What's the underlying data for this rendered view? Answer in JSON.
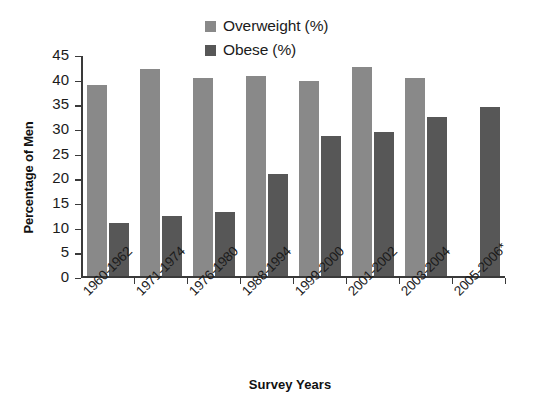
{
  "chart_data": {
    "type": "bar",
    "title": "",
    "xlabel": "Survey Years",
    "ylabel": "Percentage of Men",
    "categories": [
      "1960-1962",
      "1971-1974",
      "1976-1980",
      "1988-1994",
      "1999-2000",
      "2001-2002",
      "2003-2004",
      "2005-2006*"
    ],
    "series": [
      {
        "name": "Overweight (%)",
        "color": "#898989",
        "values": [
          38.9,
          42.0,
          40.2,
          40.6,
          39.7,
          42.4,
          40.3,
          null
        ]
      },
      {
        "name": "Obese (%)",
        "color": "#575757",
        "values": [
          10.9,
          12.2,
          13.0,
          20.8,
          28.4,
          29.2,
          32.4,
          34.4
        ]
      }
    ],
    "ylim": [
      0,
      45
    ],
    "ytick_labels": [
      "0",
      "5",
      "10",
      "15",
      "20",
      "25",
      "30",
      "35",
      "40",
      "45"
    ],
    "ytick_values": [
      0,
      5,
      10,
      15,
      20,
      25,
      30,
      35,
      40,
      45
    ],
    "grid": false,
    "legend_position": "top-center"
  }
}
